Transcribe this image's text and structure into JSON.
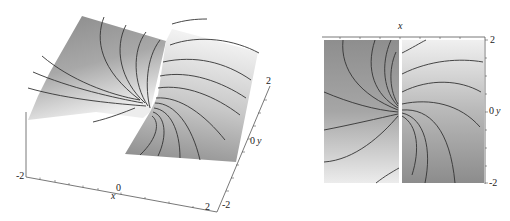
{
  "figure": {
    "left_panel": {
      "type": "3d-surface",
      "description": "Surface plot of the argument (phase) of a complex function with branch cut, spiral contour lines",
      "x_axis": {
        "label": "x",
        "ticks": [
          "-2",
          "0",
          "2"
        ]
      },
      "y_axis": {
        "label": "y",
        "ticks": [
          "-2",
          "0",
          "2"
        ]
      }
    },
    "right_panel": {
      "type": "density-contour",
      "description": "Top view density plot with spiral contour lines and vertical branch cut at x = 0",
      "x_axis": {
        "label": "x"
      },
      "y_axis": {
        "label": "y",
        "ticks": [
          "2",
          "0",
          "-2"
        ]
      }
    }
  },
  "labels": {
    "l_x_m2": "-2",
    "l_x_0": "0",
    "l_x_name": "x",
    "l_x_2": "2",
    "l_y_m2": "-2",
    "l_y_0": "0",
    "l_y_name": "y",
    "l_y_2": "2",
    "r_x_name": "x",
    "r_y_2": "2",
    "r_y_0": "0",
    "r_y_name": "y",
    "r_y_m2": "-2"
  },
  "colors": {
    "dark_gray": "#7a7a7a",
    "light_gray": "#e6e6e6",
    "contour": "#333333",
    "axis": "#555555"
  }
}
